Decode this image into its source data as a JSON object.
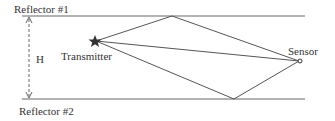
{
  "diagram": {
    "reflector_top": "Reflector #1",
    "reflector_bottom": "Reflector #2",
    "height_label": "H",
    "transmitter_label": "Transmitter",
    "sensor_label": "Sensor",
    "line_color": "#555555"
  }
}
